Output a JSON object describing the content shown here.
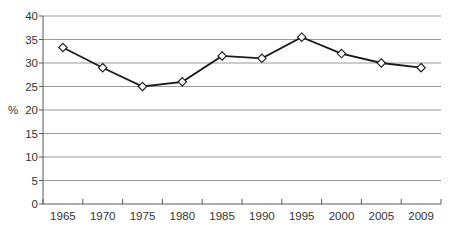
{
  "chart_data": {
    "type": "line",
    "categories": [
      "1965",
      "1970",
      "1975",
      "1980",
      "1985",
      "1990",
      "1995",
      "2000",
      "2005",
      "2009"
    ],
    "values": [
      33.3,
      29,
      25,
      26,
      31.5,
      31,
      35.5,
      32,
      30,
      29
    ],
    "title": "",
    "xlabel": "",
    "ylabel": "%",
    "ylim": [
      0,
      40
    ],
    "yticks": [
      0,
      5,
      10,
      15,
      20,
      25,
      30,
      35,
      40
    ],
    "grid": "horizontal-only",
    "legend": "none",
    "marker": "open-diamond",
    "line_color": "#1a1a1a",
    "marker_fill": "#ffffff",
    "colors": {
      "background": "#ffffff",
      "gridline": "#999999",
      "axis": "#595959",
      "tick_text": "#333333"
    }
  }
}
